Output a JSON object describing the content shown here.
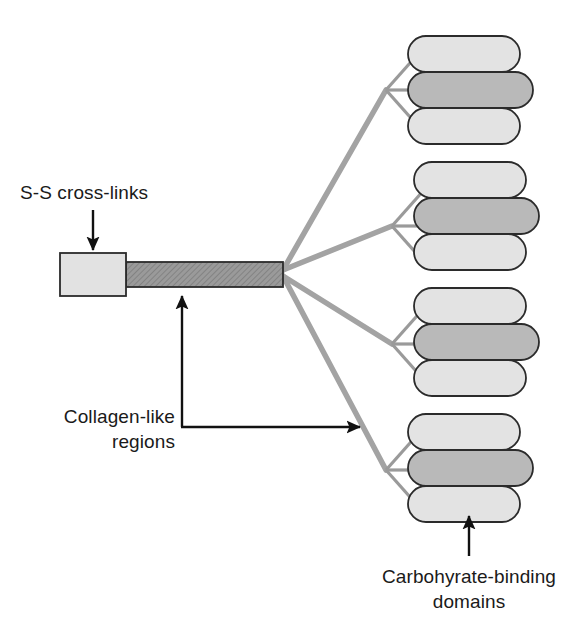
{
  "figure": {
    "background_color": "#ffffff"
  },
  "labels": {
    "ss_crosslinks": "S-S cross-links",
    "collagen_line1": "Collagen-like",
    "collagen_line2": "regions",
    "carbohydrate_line1": "Carbohyrate-binding",
    "carbohydrate_line2": "domains"
  },
  "colors": {
    "outline": "#2b2b2b",
    "text": "#1a1a1a",
    "ss_box_fill": "#e2e2e2",
    "collagen_bar_fill": "#9a9a9a",
    "collagen_bar_hatch": "#7d7d7d",
    "branch_line": "#a3a3a3",
    "fork_line": "#9a9a9a",
    "capsule_light_fill": "#e3e3e3",
    "capsule_dark_fill": "#b9b9b9",
    "arrow": "#111111"
  },
  "structure": {
    "ss_box": {
      "label": "S-S cross-links region",
      "x": 60,
      "y": 253,
      "width": 66,
      "height": 43
    },
    "collagen_bar": {
      "label": "Collagen-like triple helix bar",
      "x": 126,
      "y": 262,
      "width": 157,
      "height": 25
    },
    "fan_junction": {
      "x": 283,
      "y": 272
    },
    "branch_count": 4,
    "capsules_per_cluster": 3,
    "clusters": [
      {
        "name": "cluster-1",
        "fork_node_x": 386,
        "fork_node_y": 90,
        "capsules": [
          {
            "shade": "light",
            "x": 408,
            "y": 36,
            "width": 112,
            "height": 36
          },
          {
            "shade": "dark",
            "x": 408,
            "y": 72,
            "width": 125,
            "height": 36
          },
          {
            "shade": "light",
            "x": 408,
            "y": 108,
            "width": 112,
            "height": 36
          }
        ]
      },
      {
        "name": "cluster-2",
        "fork_node_x": 392,
        "fork_node_y": 226,
        "capsules": [
          {
            "shade": "light",
            "x": 414,
            "y": 162,
            "width": 112,
            "height": 36
          },
          {
            "shade": "dark",
            "x": 414,
            "y": 198,
            "width": 125,
            "height": 36
          },
          {
            "shade": "light",
            "x": 414,
            "y": 234,
            "width": 112,
            "height": 36
          }
        ]
      },
      {
        "name": "cluster-3",
        "fork_node_x": 392,
        "fork_node_y": 344,
        "capsules": [
          {
            "shade": "light",
            "x": 414,
            "y": 288,
            "width": 112,
            "height": 36
          },
          {
            "shade": "dark",
            "x": 414,
            "y": 324,
            "width": 125,
            "height": 36
          },
          {
            "shade": "light",
            "x": 414,
            "y": 360,
            "width": 112,
            "height": 36
          }
        ]
      },
      {
        "name": "cluster-4",
        "fork_node_x": 386,
        "fork_node_y": 470,
        "capsules": [
          {
            "shade": "light",
            "x": 408,
            "y": 414,
            "width": 112,
            "height": 36
          },
          {
            "shade": "dark",
            "x": 408,
            "y": 450,
            "width": 125,
            "height": 36
          },
          {
            "shade": "light",
            "x": 408,
            "y": 486,
            "width": 112,
            "height": 36
          }
        ]
      }
    ]
  },
  "annotations": {
    "ss_arrow": {
      "name": "ss-crosslinks-arrow",
      "from_x": 93,
      "from_y": 210,
      "to_x": 93,
      "to_y": 252
    },
    "collagen_arrow": {
      "name": "collagen-regions-elbow-arrow",
      "corner_x": 182,
      "corner_y": 427,
      "up_to_y": 291,
      "right_to_x": 366
    },
    "carbohydrate_arrow": {
      "name": "carbohydrate-domains-arrow",
      "from_x": 469,
      "from_y": 556,
      "to_x": 469,
      "to_y": 512
    }
  },
  "text_positions": {
    "ss_crosslinks": {
      "x": 20,
      "y": 199
    },
    "collagen": {
      "x": 175,
      "y": 423,
      "anchor": "end",
      "line_height": 25
    },
    "carbohydrate": {
      "x": 469,
      "y": 583,
      "anchor": "middle",
      "line_height": 25
    }
  }
}
